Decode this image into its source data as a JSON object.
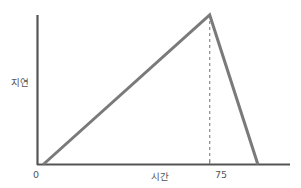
{
  "chart_data": {
    "type": "line",
    "title": "",
    "xlabel": "시간",
    "ylabel": "지연",
    "grid": false,
    "legend": null,
    "xlim": [
      0,
      110
    ],
    "ylim": [
      0,
      100
    ],
    "x_tick_labels": [
      "0",
      "75"
    ],
    "y_tick_labels": [],
    "annotations": [
      {
        "name": "peak-dashed-guideline",
        "type": "vertical-dashed-line",
        "x": 75,
        "from_y": 0,
        "to_y": 100
      }
    ],
    "series": [
      {
        "name": "delay-over-time",
        "color": "#7a7a7a",
        "points": [
          {
            "x": 2.5,
            "y": 0
          },
          {
            "x": 75,
            "y": 100
          },
          {
            "x": 96,
            "y": 0
          }
        ]
      }
    ]
  },
  "axes": {
    "origin_label": "0",
    "peak_tick_label": "75",
    "y_axis_title": "지연",
    "x_axis_title": "시간",
    "axis_color": "#555555",
    "line_color": "#7a7a7a",
    "background_color": "#ffffff"
  }
}
